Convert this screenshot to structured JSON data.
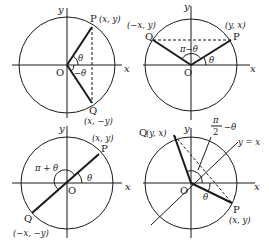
{
  "figure": {
    "panels": [
      {
        "id": "negative-angle",
        "axis_x": "x",
        "axis_y": "y",
        "origin": "O",
        "point_p": {
          "name": "P",
          "coords": "(x, y)"
        },
        "point_q": {
          "name": "Q",
          "coords": "(x, −y)"
        },
        "angle_p": "θ",
        "angle_q": "−θ"
      },
      {
        "id": "pi-minus-theta",
        "axis_x": "x",
        "axis_y": "y",
        "origin": "O",
        "point_p": {
          "name": "P",
          "coords": "(y, x)"
        },
        "point_q": {
          "name": "Q",
          "coords": "(−x, y)"
        },
        "angle_p": "θ",
        "angle_q": "π−θ"
      },
      {
        "id": "pi-plus-theta",
        "axis_x": "x",
        "axis_y": "y",
        "origin": "O",
        "point_p": {
          "name": "P",
          "coords": "(x, y)"
        },
        "point_q": {
          "name": "Q",
          "coords": "(−x, −y)"
        },
        "angle_p": "θ",
        "angle_q": "π + θ"
      },
      {
        "id": "half-pi-minus-theta",
        "axis_x": "x",
        "axis_y": "y",
        "origin": "O",
        "line_label": "y = x",
        "point_p": {
          "name": "P",
          "coords": "(x, y)"
        },
        "point_q": {
          "name": "Q",
          "coords": "(y, x)"
        },
        "angle_p": "θ",
        "angle_q_num": "π",
        "angle_q_den": "2",
        "angle_q_rest": "−θ"
      }
    ]
  }
}
